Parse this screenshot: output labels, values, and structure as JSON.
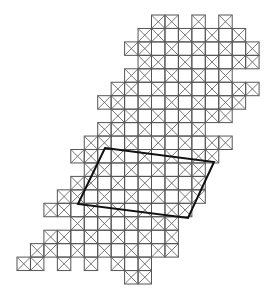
{
  "figure": {
    "title": "",
    "grid": {
      "origin_x": 17,
      "origin_y": 15,
      "cell_size": 13.45,
      "line_color": "#555555",
      "cross_color": "#666666",
      "cross_rule": "cross when (row+col) odd or on boundary",
      "rows": [
        {
          "row": 0,
          "cols": [
            10,
            11,
            13,
            15
          ]
        },
        {
          "row": 1,
          "cols": [
            9,
            10,
            11,
            12,
            13,
            14,
            15,
            16
          ]
        },
        {
          "row": 2,
          "cols": [
            8,
            9,
            10,
            11,
            12,
            13,
            14,
            15,
            16,
            17
          ]
        },
        {
          "row": 3,
          "cols": [
            9,
            10,
            11,
            12,
            13,
            14,
            15,
            16,
            17
          ]
        },
        {
          "row": 4,
          "cols": [
            8,
            9,
            10,
            11,
            12,
            13,
            14,
            15
          ]
        },
        {
          "row": 5,
          "cols": [
            7,
            8,
            9,
            10,
            11,
            12,
            13,
            14,
            15,
            16,
            17
          ]
        },
        {
          "row": 6,
          "cols": [
            6,
            7,
            8,
            9,
            10,
            11,
            12,
            13,
            14,
            15,
            16
          ]
        },
        {
          "row": 7,
          "cols": [
            7,
            8,
            9,
            10,
            11,
            12,
            13,
            14,
            15
          ]
        },
        {
          "row": 8,
          "cols": [
            6,
            7,
            8,
            9,
            10,
            11,
            12,
            13
          ]
        },
        {
          "row": 9,
          "cols": [
            5,
            6,
            7,
            8,
            9,
            10,
            11,
            12,
            13,
            14,
            15
          ]
        },
        {
          "row": 10,
          "cols": [
            4,
            5,
            6,
            7,
            8,
            9,
            10,
            11,
            12,
            13,
            14
          ]
        },
        {
          "row": 11,
          "cols": [
            5,
            6,
            7,
            8,
            9,
            10,
            11,
            12,
            13
          ]
        },
        {
          "row": 12,
          "cols": [
            4,
            5,
            6,
            7,
            8,
            9,
            10,
            11,
            12,
            13
          ]
        },
        {
          "row": 13,
          "cols": [
            3,
            4,
            5,
            6,
            7,
            8,
            9,
            10,
            11,
            12,
            13
          ]
        },
        {
          "row": 14,
          "cols": [
            2,
            3,
            4,
            5,
            6,
            7,
            8,
            9,
            10,
            11,
            12
          ]
        },
        {
          "row": 15,
          "cols": [
            4,
            5,
            6,
            7,
            8,
            9,
            10,
            11
          ]
        },
        {
          "row": 16,
          "cols": [
            2,
            3,
            4,
            5,
            6,
            7,
            8,
            9,
            10,
            11
          ]
        },
        {
          "row": 17,
          "cols": [
            1,
            2,
            3,
            4,
            5,
            6,
            7,
            8,
            9,
            10,
            11
          ]
        },
        {
          "row": 18,
          "cols": [
            0,
            1,
            3,
            5,
            7,
            8,
            9
          ]
        },
        {
          "row": 19,
          "cols": [
            8,
            9
          ]
        }
      ]
    },
    "parallelogram": {
      "points": [
        [
          105,
          148
        ],
        [
          214,
          162
        ],
        [
          188,
          218
        ],
        [
          78,
          204
        ]
      ],
      "stroke": "#111111",
      "stroke_width": 2
    }
  }
}
